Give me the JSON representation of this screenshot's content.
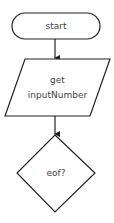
{
  "diagram": {
    "type": "flowchart",
    "nodes": [
      {
        "id": "start",
        "shape": "terminator",
        "label": "start"
      },
      {
        "id": "input",
        "shape": "parallelogram",
        "label_line1": "get",
        "label_line2": "inputNumber"
      },
      {
        "id": "decision",
        "shape": "diamond",
        "label": "eof?"
      }
    ],
    "edges": [
      {
        "from": "start",
        "to": "input"
      },
      {
        "from": "input",
        "to": "decision"
      }
    ],
    "colors": {
      "stroke": "#222222",
      "text": "#444444",
      "background": "#ffffff"
    }
  }
}
